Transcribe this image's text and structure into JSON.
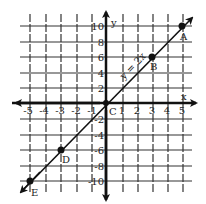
{
  "graph": {
    "x_axis_label": "x",
    "y_axis_label": "y",
    "origin_label": "C",
    "x_ticks": [
      {
        "value": -5,
        "label": "-5"
      },
      {
        "value": -4,
        "label": "-4"
      },
      {
        "value": -3,
        "label": "-3"
      },
      {
        "value": -2,
        "label": "-2"
      },
      {
        "value": -1,
        "label": "-1"
      },
      {
        "value": 1,
        "label": "1"
      },
      {
        "value": 2,
        "label": "2"
      },
      {
        "value": 3,
        "label": "3"
      },
      {
        "value": 4,
        "label": "4"
      },
      {
        "value": 5,
        "label": "5"
      }
    ],
    "y_ticks": [
      {
        "value": 10,
        "label": "10"
      },
      {
        "value": 8,
        "label": "8"
      },
      {
        "value": 6,
        "label": "6"
      },
      {
        "value": 4,
        "label": "4"
      },
      {
        "value": 2,
        "label": "2"
      },
      {
        "value": -2,
        "label": "-2"
      },
      {
        "value": -4,
        "label": "-4"
      },
      {
        "value": -6,
        "label": "-6"
      },
      {
        "value": -8,
        "label": "-8"
      },
      {
        "value": -10,
        "label": "-10"
      }
    ],
    "line_label": "y = 2x",
    "points": [
      {
        "name": "A",
        "x": 5,
        "y": 10
      },
      {
        "name": "B",
        "x": 3,
        "y": 6
      },
      {
        "name": "C",
        "x": 0,
        "y": 0
      },
      {
        "name": "D",
        "x": -3,
        "y": -6
      },
      {
        "name": "E",
        "x": -5,
        "y": -10
      }
    ],
    "colors": {
      "ink": "#111111",
      "grid": "#333333",
      "background": "#ffffff"
    }
  }
}
